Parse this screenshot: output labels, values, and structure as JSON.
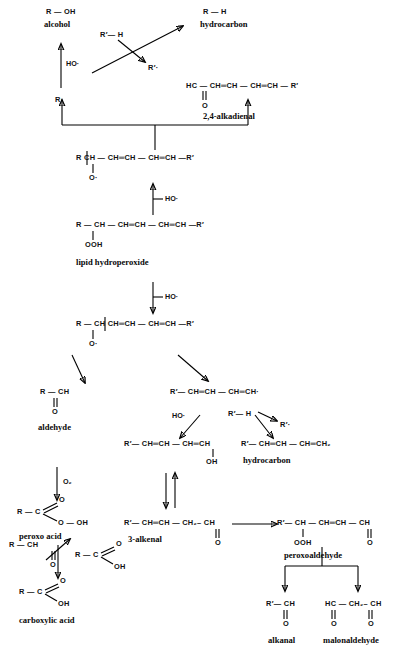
{
  "diagram": {
    "background_color": "#ffffff",
    "ink_color": "#000000"
  },
  "structures": {
    "alcohol": "R — OH",
    "alcohol_name": "alcohol",
    "hydrocarbon_top": "R — H",
    "hydrocarbon_top_name": "hydrocarbon",
    "r_h_prime": "R′— H",
    "r_radical_prime": "R′·",
    "r_radical": "R·",
    "ho_radical_1": "HO·",
    "ho_radical_2": "HO·",
    "ho_radical_3": "HO·",
    "ho_radical_4": "HO·",
    "alkadienal_chain": "HC — CH═CH — CH═CH — R′",
    "alkadienal_o": "O",
    "alkadienal_name": "2,4-alkadienal",
    "alkoxy_top_chain": "R   CH — CH═CH — CH═CH —R′",
    "alkoxy_top_o": "O·",
    "hydroperoxide_chain": "R — CH — CH═CH — CH═CH —R′",
    "hydroperoxide_ooh": "OOH",
    "hydroperoxide_name": "lipid hydroperoxide",
    "alkoxy_mid_chain": "R — CH  CH═CH — CH═CH —R′",
    "alkoxy_mid_o": "O·",
    "aldehyde_chain": "R — CH",
    "aldehyde_o": "O",
    "aldehyde_name": "aldehyde",
    "o2_label": "O₂",
    "peroxo_r": "R — C",
    "peroxo_o_top": "O",
    "peroxo_ooh": "O — OH",
    "peroxo_name": "peroxo acid",
    "aldehyde2_chain": "R — CH",
    "aldehyde2_o": "O",
    "carboxy_mid_r": "R — C",
    "carboxy_mid_o": "O",
    "carboxy_mid_oh": "OH",
    "carboxy_r": "R — C",
    "carboxy_o": "O",
    "carboxy_oh": "OH",
    "carboxy_name": "carboxylic acid",
    "pentadienyl_chain": "R′— CH═CH — CH═CH·",
    "alkadienol_chain": "R′— CH═CH — CH═CH",
    "alkadienol_oh": "OH",
    "hydrocarbon_mid_chain": "R′— CH═CH — CH═CH₂",
    "hydrocarbon_mid_name": "hydrocarbon",
    "alkenal_chain": "R′— CH═CH — CH₂– CH",
    "alkenal_o": "O",
    "alkenal_name": "3-alkenal",
    "peroxoaldehyde_chain": "R′— CH — CH═CH — CH",
    "peroxoaldehyde_ooh": "OOH",
    "peroxoaldehyde_o": "O",
    "peroxoaldehyde_name": "peroxoaldehyde",
    "alkanal_chain": "R′— CH",
    "alkanal_o": "O",
    "alkanal_name": "alkanal",
    "malonaldehyde_chain": "HC — CH₂– CH",
    "malonaldehyde_o_left": "O",
    "malonaldehyde_o_right": "O",
    "malonaldehyde_name": "malonaldehyde"
  }
}
